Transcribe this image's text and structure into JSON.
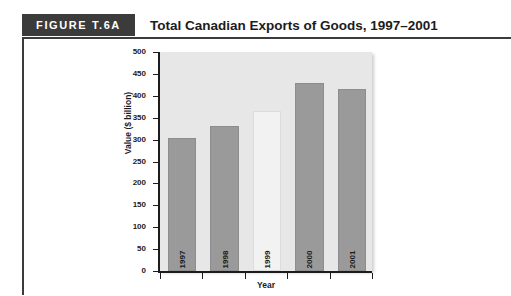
{
  "page": {
    "cutoff_text": ""
  },
  "figure": {
    "tag": "FIGURE T.6A",
    "title": "Total Canadian Exports of Goods, 1997–2001"
  },
  "chart_data": {
    "type": "bar",
    "title": "Total Canadian Exports of Goods, 1997–2001",
    "categories": [
      "1997",
      "1998",
      "1999",
      "2000",
      "2001"
    ],
    "values": [
      300,
      327,
      360,
      425,
      412
    ],
    "series": [
      {
        "name": "Total Canadian Exports of Goods",
        "values": [
          300,
          327,
          360,
          425,
          412
        ]
      }
    ],
    "xlabel": "Year",
    "ylabel": "Value ($ billion)",
    "ylim": [
      0,
      500
    ],
    "ytick_step": 50,
    "yticks": [
      "500",
      "450",
      "400",
      "350",
      "300",
      "250",
      "200",
      "150",
      "100",
      "50",
      "0"
    ],
    "grid": false,
    "legend": false,
    "bar_colors": [
      "#9a9a9a",
      "#9a9a9a",
      "#f2f2f2",
      "#9a9a9a",
      "#9a9a9a"
    ],
    "plot_background": "#e7e7e7",
    "axis_color": "#1c1c1c"
  }
}
